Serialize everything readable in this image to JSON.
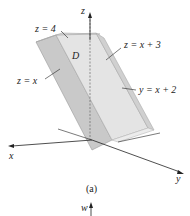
{
  "figure": {
    "caption": "(a)",
    "region_label": "D",
    "axes": {
      "x": "x",
      "y": "y",
      "z": "z",
      "w": "w"
    },
    "surfaces": [
      {
        "id": "top",
        "label": "z = 4"
      },
      {
        "id": "bottom",
        "label": "z = x"
      },
      {
        "id": "slant",
        "label": "z = x + 3"
      },
      {
        "id": "side",
        "label": "y = x + 2"
      }
    ]
  }
}
